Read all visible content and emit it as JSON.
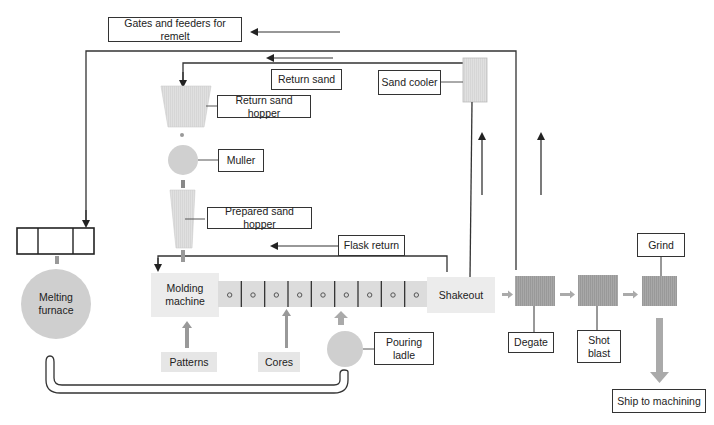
{
  "diagram": {
    "colors": {
      "line": "#333333",
      "light_fill": "#e6e6e6",
      "medium_fill": "#cccccc",
      "dark_fill": "#9a9a9a",
      "arrow_fill": "#aaaaaa"
    },
    "labels": {
      "gates_feeders": "Gates and feeders for remelt",
      "return_sand": "Return sand",
      "sand_cooler": "Sand cooler",
      "return_sand_hopper": "Return sand hopper",
      "muller": "Muller",
      "prepared_sand_hopper": "Prepared sand hopper",
      "flask_return": "Flask return",
      "molding_machine": "Molding machine",
      "melting_furnace": "Melting furnace",
      "patterns": "Patterns",
      "cores": "Cores",
      "pouring_ladle": "Pouring ladle",
      "shakeout": "Shakeout",
      "degate": "Degate",
      "shot_blast": "Shot blast",
      "grind": "Grind",
      "ship_to_machining": "Ship to machining"
    },
    "conveyor": {
      "mold_count": 9
    },
    "nodes": [
      {
        "id": "gates_feeders",
        "shape": "labeled-box"
      },
      {
        "id": "furnace_charge",
        "shape": "three-cell-bin"
      },
      {
        "id": "melting_furnace",
        "shape": "circle"
      },
      {
        "id": "return_sand_hopper",
        "shape": "trapezoid"
      },
      {
        "id": "muller",
        "shape": "circle"
      },
      {
        "id": "prepared_sand_hopper",
        "shape": "tapered-hopper"
      },
      {
        "id": "molding_machine",
        "shape": "box"
      },
      {
        "id": "mold_conveyor",
        "shape": "segmented-conveyor"
      },
      {
        "id": "shakeout",
        "shape": "box"
      },
      {
        "id": "sand_cooler",
        "shape": "box"
      },
      {
        "id": "pouring_ladle",
        "shape": "circle"
      },
      {
        "id": "degate",
        "shape": "box"
      },
      {
        "id": "shot_blast",
        "shape": "box"
      },
      {
        "id": "grind",
        "shape": "box"
      }
    ],
    "edges": [
      {
        "from": "shakeout",
        "to": "sand_cooler",
        "label": ""
      },
      {
        "from": "sand_cooler",
        "to": "return_sand_hopper",
        "label": "Return sand"
      },
      {
        "from": "return_sand_hopper",
        "to": "muller"
      },
      {
        "from": "muller",
        "to": "prepared_sand_hopper"
      },
      {
        "from": "prepared_sand_hopper",
        "to": "molding_machine"
      },
      {
        "from": "shakeout",
        "to": "molding_machine",
        "label": "Flask return"
      },
      {
        "from": "degate",
        "to": "gates_feeders",
        "label": "Gates and feeders for remelt"
      },
      {
        "from": "degate",
        "to": "furnace_charge"
      },
      {
        "from": "furnace_charge",
        "to": "melting_furnace"
      },
      {
        "from": "melting_furnace",
        "to": "pouring_ladle"
      },
      {
        "from": "pouring_ladle",
        "to": "mold_conveyor"
      },
      {
        "from": "patterns",
        "to": "molding_machine"
      },
      {
        "from": "cores",
        "to": "mold_conveyor"
      },
      {
        "from": "molding_machine",
        "to": "mold_conveyor"
      },
      {
        "from": "mold_conveyor",
        "to": "shakeout"
      },
      {
        "from": "shakeout",
        "to": "degate"
      },
      {
        "from": "degate",
        "to": "shot_blast"
      },
      {
        "from": "shot_blast",
        "to": "grind"
      },
      {
        "from": "grind",
        "to": "ship_to_machining"
      }
    ]
  }
}
